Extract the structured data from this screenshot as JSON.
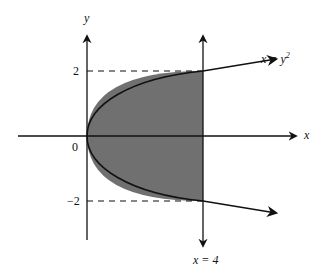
{
  "diagram": {
    "type": "region-between-curves",
    "axes": {
      "x_label": "x",
      "y_label": "y",
      "origin_label": "0"
    },
    "curve": {
      "equation_lhs": "x = y",
      "equation_exp": "2"
    },
    "vertical_line": {
      "label": "x = 4",
      "x_value": 4
    },
    "ticks": {
      "y_upper": "2",
      "y_lower": "−2"
    },
    "shaded_region": {
      "description": "Region bounded by x = y^2 and x = 4",
      "fill": "#707070"
    },
    "colors": {
      "line": "#111111",
      "fill": "#707070",
      "background": "#ffffff"
    }
  }
}
